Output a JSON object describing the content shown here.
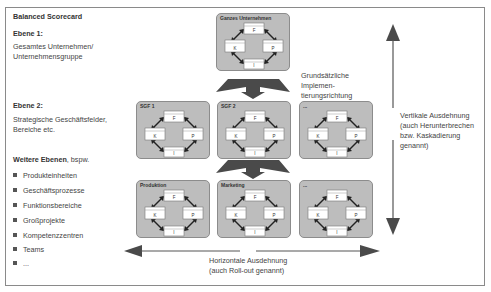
{
  "title": "Balanced Scorecard",
  "left_panel": {
    "level1_heading": "Ebene 1:",
    "level1_text": [
      "Gesamtes Unternehmen/",
      "Unternehmensgruppe"
    ],
    "level2_heading": "Ebene 2:",
    "level2_text": [
      "Strategische Geschäftsfelder,",
      "Bereiche etc."
    ],
    "further_heading_bold": "Weitere Ebenen",
    "further_heading_rest": ", bspw.",
    "further_items": [
      "Produkteinheiten",
      "Geschäftsprozesse",
      "Funktionsbereiche",
      "Großprojekte",
      "Kompetenzzentren",
      "Teams",
      "..."
    ]
  },
  "units": {
    "top": {
      "label": "Ganzes Unternehmen"
    },
    "level2": [
      {
        "label": "SGF 1"
      },
      {
        "label": "SGF 2"
      },
      {
        "label": "..."
      }
    ],
    "level3": [
      {
        "label": "Produktion"
      },
      {
        "label": "Marketing"
      },
      {
        "label": "..."
      }
    ]
  },
  "perspectives": {
    "top": "F",
    "left": "K",
    "right": "P",
    "bottom": "I"
  },
  "annotations": {
    "implementation_direction": [
      "Grundsätzliche",
      "Implemen-",
      "tierungsrichtung"
    ],
    "vertical": [
      "Vertikale Ausdehnung",
      "(auch Herunterbrechen",
      "bzw. Kaskadierung",
      "genannt)"
    ],
    "horizontal": [
      "Horizontale Ausdehnung",
      "(auch Roll-out genannt)"
    ]
  },
  "colors": {
    "unit_fill": "#bdbdbd",
    "arrow": "#4a4a4a",
    "frame": "#8a8a8a"
  }
}
